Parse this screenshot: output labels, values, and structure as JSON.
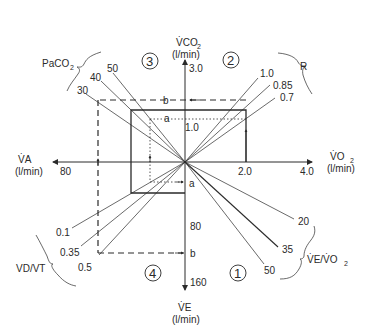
{
  "colors": {
    "ink": "#2a2a2a",
    "background": "#ffffff"
  },
  "axes": {
    "vco2": {
      "label_main": "V̇CO",
      "label_sub": "2",
      "unit": "(l/min)",
      "ticks": [
        "1.0",
        "3.0"
      ]
    },
    "vo2": {
      "label_main": "V̇O",
      "label_sub": "2",
      "unit": "(l/min)",
      "ticks": [
        "2.0",
        "4.0"
      ]
    },
    "va": {
      "label_main": "V̇A",
      "unit": "(l/min)",
      "ticks": [
        "80"
      ]
    },
    "ve": {
      "label_main": "V̇E",
      "unit": "(l/min)",
      "ticks": [
        "80",
        "160"
      ]
    }
  },
  "quadrants": [
    "①",
    "②",
    "③",
    "④"
  ],
  "markers": {
    "a": "a",
    "b": "b"
  },
  "families": {
    "paco2": {
      "label_main": "PaCO",
      "label_sub": "2",
      "values": [
        "30",
        "40",
        "50"
      ]
    },
    "r": {
      "label": "R",
      "values": [
        "1.0",
        "0.85",
        "0.7"
      ]
    },
    "vdvt": {
      "label": "VD/VT",
      "values": [
        "0.1",
        "0.35",
        "0.5"
      ]
    },
    "vevo2": {
      "label_main": "V̇E/V̇O",
      "label_sub": "2",
      "values": [
        "20",
        "35",
        "50"
      ]
    }
  }
}
